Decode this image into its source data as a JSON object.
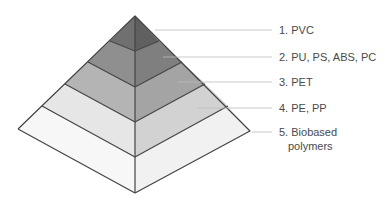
{
  "diagram": {
    "type": "pyramid",
    "layers": [
      {
        "rank": 1,
        "label_lines": [
          "1. PVC"
        ],
        "left_fill": "#707070",
        "right_fill": "#606060"
      },
      {
        "rank": 2,
        "label_lines": [
          "2. PU, PS, ABS, PC"
        ],
        "left_fill": "#8f8f8f",
        "right_fill": "#7f7f7f"
      },
      {
        "rank": 3,
        "label_lines": [
          "3. PET"
        ],
        "left_fill": "#b4b4b4",
        "right_fill": "#a4a4a4"
      },
      {
        "rank": 4,
        "label_lines": [
          "4. PE, PP"
        ],
        "left_fill": "#e6e6e6",
        "right_fill": "#d2d2d2"
      },
      {
        "rank": 5,
        "label_lines": [
          "5. Biobased",
          "polymers"
        ],
        "left_fill": "#f7f7f7",
        "right_fill": "#f1f1f1"
      }
    ],
    "edge_color": "#444444",
    "leader_color": "#bcbcbc"
  }
}
